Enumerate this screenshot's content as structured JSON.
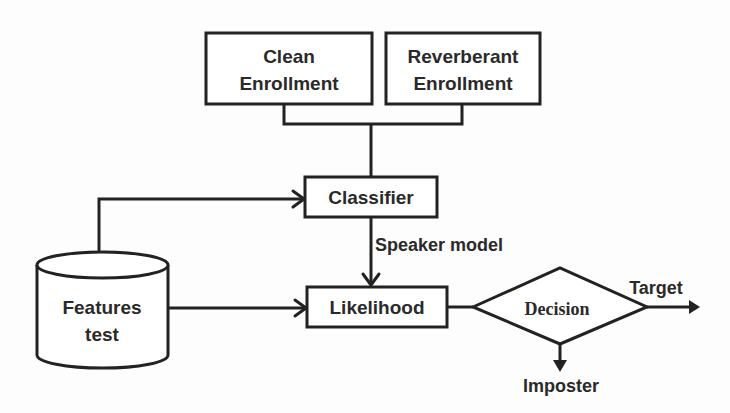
{
  "diagram": {
    "nodes": {
      "clean_enrollment": {
        "line1": "Clean",
        "line2": "Enrollment"
      },
      "reverberant_enrollment": {
        "line1": "Reverberant",
        "line2": "Enrollment"
      },
      "classifier": {
        "label": "Classifier"
      },
      "likelihood": {
        "label": "Likelihood"
      },
      "features_test": {
        "line1": "Features",
        "line2": "test"
      },
      "decision": {
        "label": "Decision"
      }
    },
    "edges": {
      "speaker_model": "Speaker model",
      "target": "Target",
      "imposter": "Imposter"
    },
    "colors": {
      "stroke": "#222222",
      "text": "#2a2a2a",
      "background": "#fdfdfd"
    }
  }
}
